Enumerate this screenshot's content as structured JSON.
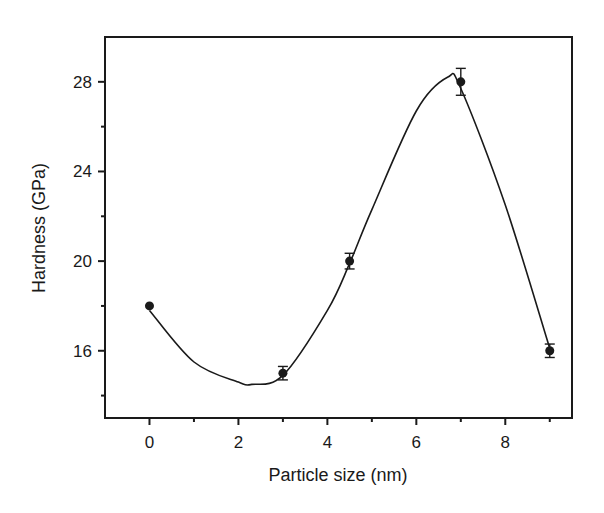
{
  "chart_data": {
    "type": "scatter",
    "title": "",
    "xlabel": "Particle size (nm)",
    "ylabel": "Hardness (GPa)",
    "xlim": [
      -1,
      9.5
    ],
    "ylim": [
      13,
      30
    ],
    "x_ticks": [
      0,
      2,
      4,
      6,
      8
    ],
    "x_tick_labels": [
      "0",
      "2",
      "4",
      "6",
      "8"
    ],
    "x_minor_ticks": [
      1,
      3,
      5,
      7,
      9
    ],
    "y_ticks": [
      16,
      20,
      24,
      28
    ],
    "y_tick_labels": [
      "16",
      "20",
      "24",
      "28"
    ],
    "y_minor_ticks": [
      14,
      18,
      22,
      26
    ],
    "grid": false,
    "legend": null,
    "series": [
      {
        "name": "Hardness",
        "marker": "filled-circle",
        "x": [
          0,
          3,
          4.5,
          7,
          9
        ],
        "y": [
          18,
          15,
          20,
          28,
          16
        ],
        "error": [
          0,
          0.3,
          0.35,
          0.6,
          0.3
        ]
      }
    ],
    "fit_curve": {
      "name": "smooth-fit",
      "x": [
        0,
        1,
        2,
        2.3,
        3,
        4,
        4.5,
        5,
        6,
        6.7,
        7,
        8,
        9
      ],
      "y": [
        17.8,
        15.5,
        14.6,
        14.5,
        14.9,
        17.8,
        19.9,
        22.3,
        26.7,
        28.2,
        27.7,
        22.5,
        16.1
      ]
    },
    "colors": {
      "ink": "#1a1a1a",
      "background": "#ffffff"
    }
  }
}
